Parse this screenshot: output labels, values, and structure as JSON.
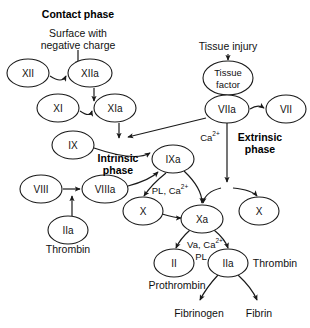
{
  "diagram": {
    "headings": {
      "contact_phase": "Contact phase",
      "intrinsic_phase_line1": "Intrinsic",
      "intrinsic_phase_line2": "phase",
      "extrinsic_phase_line1": "Extrinsic",
      "extrinsic_phase_line2": "phase"
    },
    "inputs": {
      "surface_line1": "Surface with",
      "surface_line2": "negative charge",
      "tissue_injury": "Tissue injury"
    },
    "nodes": [
      {
        "id": "XII",
        "label": "XII",
        "cx": 28,
        "cy": 73,
        "rx": 21,
        "ry": 14
      },
      {
        "id": "XIIa",
        "label": "XIIa",
        "cx": 90,
        "cy": 73,
        "rx": 22,
        "ry": 14
      },
      {
        "id": "XI",
        "label": "XI",
        "cx": 58,
        "cy": 108,
        "rx": 21,
        "ry": 14
      },
      {
        "id": "XIa",
        "label": "XIa",
        "cx": 115,
        "cy": 108,
        "rx": 21,
        "ry": 14
      },
      {
        "id": "IX",
        "label": "IX",
        "cx": 73,
        "cy": 145,
        "rx": 21,
        "ry": 14
      },
      {
        "id": "IXa",
        "label": "IXa",
        "cx": 173,
        "cy": 159,
        "rx": 21,
        "ry": 14
      },
      {
        "id": "VIII",
        "label": "VIII",
        "cx": 41,
        "cy": 189,
        "rx": 21,
        "ry": 14
      },
      {
        "id": "VIIIa",
        "label": "VIIIa",
        "cx": 105,
        "cy": 189,
        "rx": 23,
        "ry": 14
      },
      {
        "id": "X_left",
        "label": "X",
        "cx": 143,
        "cy": 211,
        "rx": 20,
        "ry": 14
      },
      {
        "id": "IIa_left",
        "label": "IIa",
        "cx": 68,
        "cy": 230,
        "rx": 20,
        "ry": 14
      },
      {
        "id": "TF",
        "label": "Tissue|factor",
        "cx": 228,
        "cy": 78,
        "rx": 25,
        "ry": 17
      },
      {
        "id": "VIIa",
        "label": "VIIa",
        "cx": 227,
        "cy": 109,
        "rx": 22,
        "ry": 14
      },
      {
        "id": "VII",
        "label": "VII",
        "cx": 286,
        "cy": 109,
        "rx": 20,
        "ry": 14
      },
      {
        "id": "X_right",
        "label": "X",
        "cx": 259,
        "cy": 211,
        "rx": 20,
        "ry": 14
      },
      {
        "id": "Xa",
        "label": "Xa",
        "cx": 202,
        "cy": 219,
        "rx": 21,
        "ry": 14
      },
      {
        "id": "II",
        "label": "II",
        "cx": 174,
        "cy": 263,
        "rx": 20,
        "ry": 14
      },
      {
        "id": "IIa_right",
        "label": "IIa",
        "cx": 228,
        "cy": 263,
        "rx": 20,
        "ry": 14
      }
    ],
    "annotations": {
      "calcium": "Ca",
      "calcium_charge": "2+",
      "pl_calcium": "PL, Ca",
      "pl_calcium_charge": "2+",
      "va_calcium": "Va, Ca",
      "va_calcium_charge": "2+",
      "pl": "PL"
    },
    "products": {
      "thrombin_left": "Thrombin",
      "thrombin_right": "Thrombin",
      "prothrombin": "Prothrombin",
      "fibrinogen": "Fibrinogen",
      "fibrin": "Fibrin"
    },
    "colors": {
      "stroke": "#1a1a1a",
      "text": "#111111",
      "background": "#ffffff"
    }
  }
}
